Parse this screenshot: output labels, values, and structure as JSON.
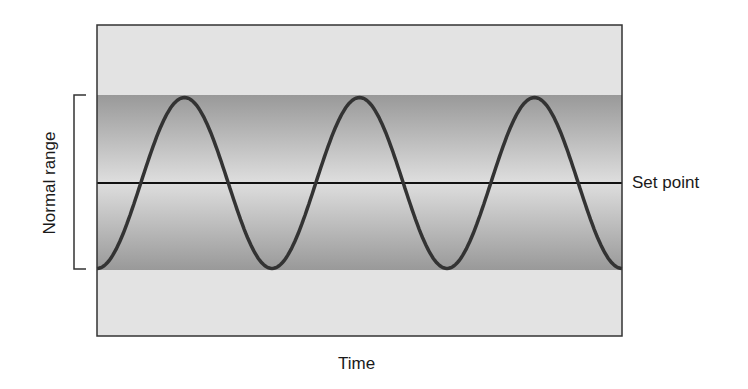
{
  "chart_data": {
    "type": "line",
    "title": "",
    "xlabel": "Time",
    "ylabel": "",
    "series": [
      {
        "name": "regulated variable",
        "shape": "sine",
        "cycles": 3,
        "starts_at": "minimum",
        "amplitude": "full normal range"
      },
      {
        "name": "Set point",
        "shape": "horizontal line",
        "position": "center of normal range"
      }
    ],
    "annotations": [
      {
        "text": "Normal range",
        "type": "bracket",
        "spans": "shaded band"
      },
      {
        "text": "Set point",
        "type": "line label"
      }
    ],
    "grid": false
  },
  "labels": {
    "x_axis": "Time",
    "normal_range": "Normal range",
    "set_point": "Set point"
  },
  "colors": {
    "outer_bg": "#e3e3e3",
    "band_edge": "#999999",
    "band_center": "#dedede",
    "curve": "#333333",
    "line": "#111111",
    "frame": "#333333"
  }
}
